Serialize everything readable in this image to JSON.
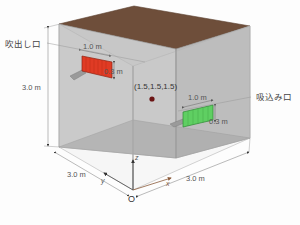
{
  "figure": {
    "type": "3d-room-diagram",
    "background_color": "#fdfdfd"
  },
  "room": {
    "shape": "cube",
    "wall_color": "#b9b9b9",
    "floor_color": "#a9a9a9",
    "ceiling_color": "#6e4e3a",
    "edge_color": "#8a8a8a",
    "dimensions": {
      "height_label": "3.0 m",
      "depth_label": "3.0 m",
      "width_label": "3.0 m"
    }
  },
  "supply": {
    "name_label": "吹出し口",
    "color": "#e03b24",
    "width_label": "1.0 m",
    "height_label": "0.3 m"
  },
  "return": {
    "name_label": "吸込み口",
    "color": "#5fcf62",
    "width_label": "1.0 m",
    "height_label": "0.3 m"
  },
  "point": {
    "coord_label": "(1.5,1.5,1.5)",
    "color": "#6b1414"
  },
  "axes": {
    "x_label": "x",
    "y_label": "y",
    "z_label": "z",
    "origin_label": "O",
    "x_color": "#8a5a3a",
    "y_color": "#4a4a4a",
    "z_color": "#4a4a4a"
  }
}
